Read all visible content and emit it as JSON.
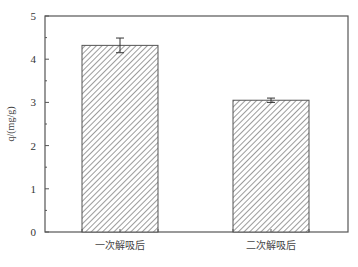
{
  "chart_data": {
    "type": "bar",
    "title": "",
    "xlabel": "",
    "ylabel": "q/(mg/g)",
    "ylim": [
      0,
      5
    ],
    "yticks": [
      0,
      1,
      2,
      3,
      4,
      5
    ],
    "categories": [
      "一次解吸后",
      "二次解吸后"
    ],
    "values": [
      4.32,
      3.05
    ],
    "errors": [
      0.17,
      0.05
    ],
    "bar_fill": "hatched diagonal",
    "grid": false,
    "legend": null
  },
  "colors": {
    "axis": "#555555",
    "hatch": "#666666",
    "bar_bg": "#ffffff"
  }
}
